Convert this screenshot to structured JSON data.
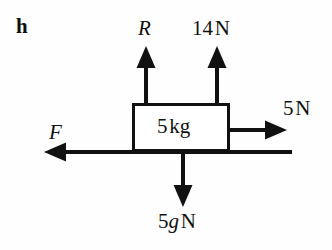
{
  "diagram": {
    "part_label": "h",
    "type": "free-body-force-diagram",
    "background_color": "#fefefe",
    "stroke_color": "#111111",
    "canvas": {
      "width": 332,
      "height": 250
    },
    "body": {
      "shape": "rectangle",
      "mass_label": "5 kg",
      "mass_value": "5",
      "mass_unit": "kg",
      "left": 132,
      "top": 103,
      "right": 230,
      "bottom": 152,
      "border_width": 3,
      "fill": "#ffffff"
    },
    "forces": [
      {
        "name": "normal-reaction",
        "label": "R",
        "style": "italic",
        "direction": "up",
        "origin_x": 146,
        "origin_y": 103,
        "tip_y": 48,
        "label_x": 138,
        "label_y": 18
      },
      {
        "name": "applied-upward",
        "label": "14 N",
        "value": "14",
        "unit": "N",
        "style": "upright",
        "direction": "up",
        "origin_x": 217,
        "origin_y": 103,
        "tip_y": 48,
        "label_x": 192,
        "label_y": 18
      },
      {
        "name": "applied-rightward",
        "label": "5 N",
        "value": "5",
        "unit": "N",
        "style": "upright",
        "direction": "right",
        "origin_x": 230,
        "origin_y": 130,
        "tip_x": 286,
        "label_x": 283,
        "label_y": 98
      },
      {
        "name": "friction-or-applied-leftward",
        "label": "F",
        "style": "italic",
        "direction": "left",
        "origin_x": 292,
        "origin_y": 152,
        "tip_x": 45,
        "label_x": 49,
        "label_y": 122
      },
      {
        "name": "weight",
        "label": "5g N",
        "value": "5g",
        "unit": "N",
        "style": "mixed-italic-g",
        "direction": "down",
        "origin_x": 183,
        "origin_y": 152,
        "tip_y": 206,
        "label_x": 158,
        "label_y": 211
      }
    ],
    "weight_label_parts": {
      "coefficient": "5",
      "symbol": "g",
      "unit": "N"
    },
    "up_force_label_parts": {
      "magnitude": "14",
      "unit": "N"
    },
    "right_force_label_parts": {
      "magnitude": "5",
      "unit": "N"
    },
    "mass_label_parts": {
      "magnitude": "5",
      "unit": "kg"
    }
  }
}
